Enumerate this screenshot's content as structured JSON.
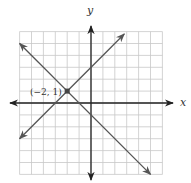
{
  "chart_data": {
    "type": "line",
    "title": "",
    "xlabel": "x",
    "ylabel": "y",
    "xlim": [
      -6,
      6
    ],
    "ylim": [
      -6,
      6
    ],
    "grid": true,
    "grid_step": 1,
    "series": [
      {
        "name": "line-rising",
        "equation": "y = x + 3",
        "slope": 1,
        "intercept": 3,
        "x": [
          -6,
          2.8
        ],
        "y": [
          -3,
          5.8
        ]
      },
      {
        "name": "line-falling",
        "equation": "y = -x - 1",
        "slope": -1,
        "intercept": -1,
        "x": [
          -6,
          5
        ],
        "y": [
          5,
          -6
        ]
      }
    ],
    "annotations": [
      {
        "text": "(−2, 1)",
        "x": -2,
        "y": 1,
        "marker": "square"
      }
    ]
  },
  "labels": {
    "x_axis": "x",
    "y_axis": "y",
    "point": "(−2, 1)"
  },
  "colors": {
    "grid": "#c8c8c8",
    "axis": "#222222",
    "line": "#555555",
    "point": "#444444"
  }
}
